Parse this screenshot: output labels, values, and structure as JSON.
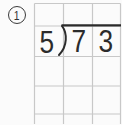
{
  "worksheet": {
    "problem_number": "1",
    "operation": "long-division",
    "divisor": "5",
    "dividend": "73",
    "dividend_digits": [
      "7",
      "3"
    ]
  },
  "grid": {
    "columns": 3,
    "rows": 4,
    "answer_rows_empty": true
  },
  "colors": {
    "background": "#fbfbfb",
    "grid_line": "#c8c8c8",
    "ink": "#2b2b2b"
  }
}
